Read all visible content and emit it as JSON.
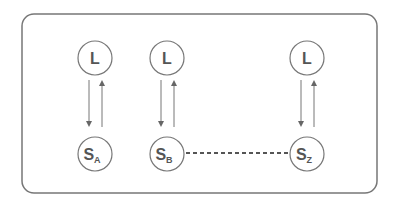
{
  "diagram": {
    "colors": {
      "stroke": "#666666",
      "text": "#555555",
      "frame": "#777777"
    },
    "columns": [
      {
        "id": "A",
        "top_label": "L",
        "bottom_label": "S",
        "bottom_subscript": "A"
      },
      {
        "id": "B",
        "top_label": "L",
        "bottom_label": "S",
        "bottom_subscript": "B"
      },
      {
        "id": "Z",
        "top_label": "L",
        "bottom_label": "S",
        "bottom_subscript": "Z"
      }
    ],
    "connector": {
      "style": "dotted",
      "from": "S_B",
      "to": "S_Z"
    }
  }
}
